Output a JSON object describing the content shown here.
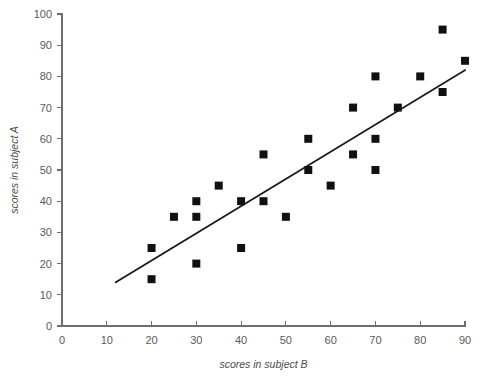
{
  "chart_data": {
    "type": "scatter",
    "title": "",
    "xlabel": "scores in subject B",
    "ylabel": "scores in subject A",
    "xlim": [
      0,
      90
    ],
    "ylim": [
      0,
      100
    ],
    "xticks": [
      0,
      10,
      20,
      30,
      40,
      50,
      60,
      70,
      80,
      90
    ],
    "yticks": [
      0,
      10,
      20,
      30,
      40,
      50,
      60,
      70,
      80,
      90,
      100
    ],
    "xtick_labels": [
      "0",
      "10",
      "20",
      "30",
      "40",
      "50",
      "60",
      "70",
      "80",
      "90"
    ],
    "ytick_labels": [
      "0",
      "10",
      "20",
      "30",
      "40",
      "50",
      "60",
      "70",
      "80",
      "90",
      "100"
    ],
    "grid": false,
    "legend": false,
    "marker": "square",
    "marker_color": "#111111",
    "points": [
      {
        "x": 20,
        "y": 25
      },
      {
        "x": 20,
        "y": 15
      },
      {
        "x": 25,
        "y": 35
      },
      {
        "x": 30,
        "y": 40
      },
      {
        "x": 30,
        "y": 35
      },
      {
        "x": 30,
        "y": 20
      },
      {
        "x": 35,
        "y": 45
      },
      {
        "x": 40,
        "y": 40
      },
      {
        "x": 40,
        "y": 25
      },
      {
        "x": 45,
        "y": 55
      },
      {
        "x": 45,
        "y": 40
      },
      {
        "x": 50,
        "y": 35
      },
      {
        "x": 55,
        "y": 60
      },
      {
        "x": 55,
        "y": 50
      },
      {
        "x": 60,
        "y": 45
      },
      {
        "x": 65,
        "y": 70
      },
      {
        "x": 65,
        "y": 55
      },
      {
        "x": 70,
        "y": 80
      },
      {
        "x": 70,
        "y": 60
      },
      {
        "x": 70,
        "y": 50
      },
      {
        "x": 75,
        "y": 70
      },
      {
        "x": 80,
        "y": 80
      },
      {
        "x": 85,
        "y": 95
      },
      {
        "x": 85,
        "y": 75
      },
      {
        "x": 90,
        "y": 85
      }
    ],
    "trend_line": {
      "name": "line of best fit",
      "x_start": 12,
      "y_start": 14,
      "x_end": 90,
      "y_end": 82,
      "color": "#1a1a1a"
    }
  }
}
